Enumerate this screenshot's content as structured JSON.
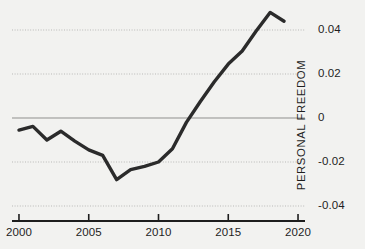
{
  "chart_data": {
    "type": "line",
    "title": "",
    "xlabel": "",
    "ylabel": "PERSONAL FREEDOM",
    "xlim": [
      1999.5,
      2020.5
    ],
    "ylim": [
      -0.045,
      0.052
    ],
    "grid": true,
    "legend": null,
    "x_ticks": [
      "2000",
      "2005",
      "2010",
      "2015",
      "2020"
    ],
    "x_tick_values": [
      2000,
      2005,
      2010,
      2015,
      2020
    ],
    "y_ticks": [
      "0.04",
      "0.02",
      "0",
      "-0.02",
      "-0.04"
    ],
    "y_tick_values": [
      0.04,
      0.02,
      0,
      -0.02,
      -0.04
    ],
    "zero_line": 0,
    "series": [
      {
        "name": "Personal Freedom",
        "color": "#2b2b2b",
        "x": [
          2000,
          2001,
          2002,
          2003,
          2004,
          2005,
          2006,
          2007,
          2008,
          2009,
          2010,
          2011,
          2012,
          2013,
          2014,
          2015,
          2016,
          2017,
          2018,
          2019
        ],
        "values": [
          -0.0055,
          -0.0038,
          -0.01,
          -0.006,
          -0.0105,
          -0.0145,
          -0.017,
          -0.028,
          -0.0235,
          -0.022,
          -0.02,
          -0.014,
          -0.002,
          0.0075,
          0.0165,
          0.0245,
          0.0305,
          0.0395,
          0.048,
          0.044
        ]
      }
    ]
  },
  "colors": {
    "background": "#f2f2f0",
    "line": "#2b2b2b",
    "grid": "#b9b9b7",
    "zero_line": "#8f8f8d",
    "axis": "#1e1e1e",
    "text": "#1e1e1e"
  }
}
